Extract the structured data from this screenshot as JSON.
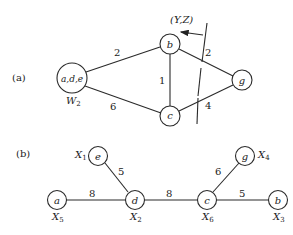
{
  "part_a": {
    "label": "(a)",
    "cut_label": "(Y,Z)",
    "nodes": [
      {
        "id": "ade",
        "label": "a,d,e",
        "weight_label": "W",
        "weight_sub": "2"
      },
      {
        "id": "b",
        "label": "b"
      },
      {
        "id": "c",
        "label": "c"
      },
      {
        "id": "g",
        "label": "g"
      }
    ],
    "edges": [
      {
        "from": "ade",
        "to": "b",
        "weight": "2"
      },
      {
        "from": "ade",
        "to": "c",
        "weight": "6"
      },
      {
        "from": "b",
        "to": "c",
        "weight": "1"
      },
      {
        "from": "b",
        "to": "g",
        "weight": "2"
      },
      {
        "from": "c",
        "to": "g",
        "weight": "4"
      }
    ]
  },
  "part_b": {
    "label": "(b)",
    "nodes": [
      {
        "id": "e",
        "label": "e",
        "x_label": "X",
        "x_sub": "1"
      },
      {
        "id": "a",
        "label": "a",
        "x_label": "X",
        "x_sub": "5"
      },
      {
        "id": "d",
        "label": "d",
        "x_label": "X",
        "x_sub": "2"
      },
      {
        "id": "c",
        "label": "c",
        "x_label": "X",
        "x_sub": "6"
      },
      {
        "id": "g",
        "label": "g",
        "x_label": "X",
        "x_sub": "4"
      },
      {
        "id": "b",
        "label": "b",
        "x_label": "X",
        "x_sub": "3"
      }
    ],
    "edges": [
      {
        "from": "e",
        "to": "d",
        "weight": "5"
      },
      {
        "from": "a",
        "to": "d",
        "weight": "8"
      },
      {
        "from": "d",
        "to": "c",
        "weight": "8"
      },
      {
        "from": "c",
        "to": "g",
        "weight": "6"
      },
      {
        "from": "c",
        "to": "b",
        "weight": "5"
      }
    ]
  }
}
